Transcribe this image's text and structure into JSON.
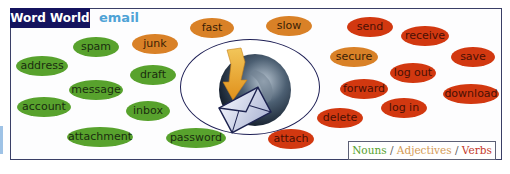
{
  "header": {
    "title": "Word World",
    "topic": "email"
  },
  "colors": {
    "noun": "#58a22d",
    "adjective": "#d98127",
    "verb": "#d23810",
    "header_bg": "#14135e",
    "topic": "#4fa3d6"
  },
  "words": {
    "nouns": [
      {
        "label": "spam",
        "x": 96,
        "y": 47,
        "w": 46
      },
      {
        "label": "address",
        "x": 42,
        "y": 66,
        "w": 52
      },
      {
        "label": "draft",
        "x": 153,
        "y": 75,
        "w": 46
      },
      {
        "label": "message",
        "x": 96,
        "y": 90,
        "w": 54
      },
      {
        "label": "account",
        "x": 44,
        "y": 107,
        "w": 54
      },
      {
        "label": "inbox",
        "x": 148,
        "y": 111,
        "w": 44
      },
      {
        "label": "attachment",
        "x": 100,
        "y": 137,
        "w": 66
      },
      {
        "label": "password",
        "x": 196,
        "y": 138,
        "w": 60
      }
    ],
    "adjectives": [
      {
        "label": "junk",
        "x": 155,
        "y": 44,
        "w": 46
      },
      {
        "label": "fast",
        "x": 212,
        "y": 28,
        "w": 44
      },
      {
        "label": "slow",
        "x": 289,
        "y": 26,
        "w": 46
      },
      {
        "label": "secure",
        "x": 354,
        "y": 57,
        "w": 48
      }
    ],
    "verbs": [
      {
        "label": "send",
        "x": 370,
        "y": 27,
        "w": 46
      },
      {
        "label": "receive",
        "x": 425,
        "y": 36,
        "w": 48
      },
      {
        "label": "save",
        "x": 473,
        "y": 57,
        "w": 44
      },
      {
        "label": "log out",
        "x": 413,
        "y": 73,
        "w": 46
      },
      {
        "label": "forward",
        "x": 364,
        "y": 89,
        "w": 48
      },
      {
        "label": "download",
        "x": 471,
        "y": 94,
        "w": 56
      },
      {
        "label": "log in",
        "x": 404,
        "y": 108,
        "w": 46
      },
      {
        "label": "delete",
        "x": 340,
        "y": 118,
        "w": 46
      },
      {
        "label": "attach",
        "x": 291,
        "y": 139,
        "w": 46
      }
    ]
  },
  "center_icon": "globe-email-icon",
  "legend": {
    "nouns": "Nouns",
    "adjectives": "Adjectives",
    "verbs": "Verbs",
    "separator": "/"
  }
}
